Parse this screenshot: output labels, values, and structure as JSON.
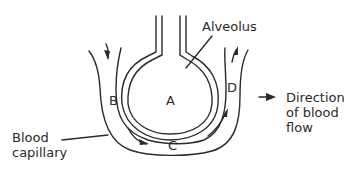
{
  "diagram": {
    "labels": {
      "alveolus": "Alveolus",
      "a": "A",
      "b": "B",
      "c": "C",
      "d": "D",
      "blood_capillary": "Blood\ncapillary",
      "direction": "Direction\nof blood\nflow"
    },
    "colors": {
      "stroke": "#2a2a2a",
      "background": "#ffffff"
    }
  }
}
